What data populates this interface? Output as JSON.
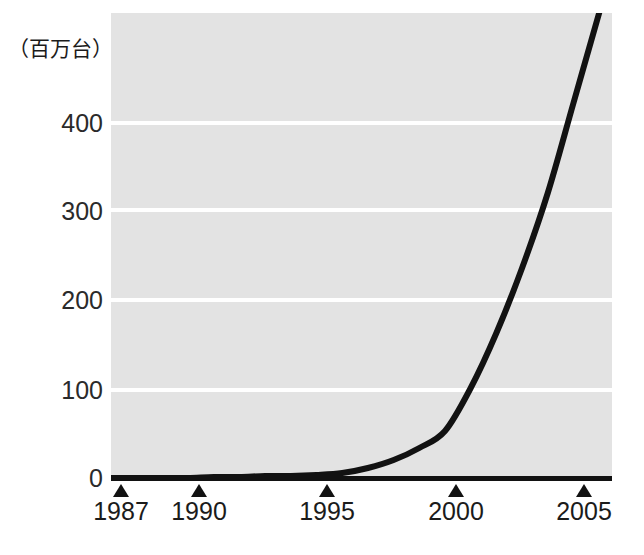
{
  "chart_data": {
    "type": "line",
    "title": "",
    "subtitle": "",
    "xlabel": "",
    "ylabel": "（百万台）",
    "unit_label": "（百万台）",
    "xlim": [
      1987,
      2006.5
    ],
    "ylim": [
      0,
      465
    ],
    "grid": true,
    "grid_color": "#ffffff",
    "plot_background": "#e3e3e3",
    "line_color": "#121212",
    "line_width": 6,
    "legend": null,
    "legend_position": "none",
    "yticks": [
      0,
      100,
      200,
      300,
      400
    ],
    "ytick_labels": [
      "0",
      "100",
      "200",
      "300",
      "400"
    ],
    "xticks": [
      1987,
      1990,
      1995,
      2000,
      2005
    ],
    "xtick_labels": [
      "1987",
      "1990",
      "1995",
      "2000",
      "2005"
    ],
    "x": [
      1987,
      1988,
      1989,
      1990,
      1991,
      1992,
      1993,
      1994,
      1995,
      1996,
      1997,
      1998,
      1999,
      2000,
      2001,
      2002,
      2003,
      2004,
      2005,
      2006
    ],
    "values": [
      0,
      0,
      0,
      0,
      1,
      1,
      2,
      2,
      3,
      5,
      10,
      18,
      30,
      47,
      90,
      145,
      210,
      285,
      375,
      465
    ],
    "series": [
      {
        "name": "",
        "values": [
          0,
          0,
          0,
          0,
          1,
          1,
          2,
          2,
          3,
          5,
          10,
          18,
          30,
          47,
          90,
          145,
          210,
          285,
          375,
          465
        ]
      }
    ],
    "annotations": []
  },
  "axis": {
    "y_unit": "（百万台）",
    "y_tick_labels": [
      "400",
      "300",
      "200",
      "100",
      "0"
    ],
    "x_tick_labels": [
      "1987",
      "1990",
      "1995",
      "2000",
      "2005"
    ]
  }
}
